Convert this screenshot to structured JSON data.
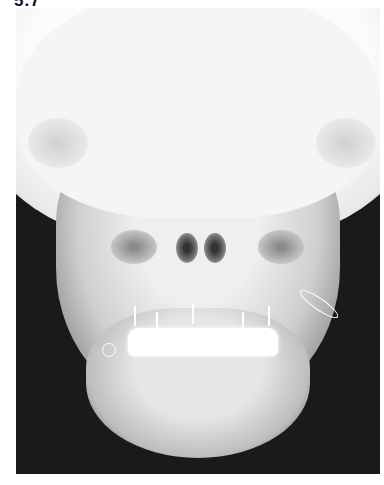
{
  "figure": {
    "label": "5.7",
    "image": {
      "type": "radiograph",
      "description": "Posteroanterior skull X-ray showing maxillofacial fixation hardware with arch bars and wiring on the teeth",
      "background_color": "#1a1a1a",
      "bone_color": "#f2f2f2"
    }
  }
}
